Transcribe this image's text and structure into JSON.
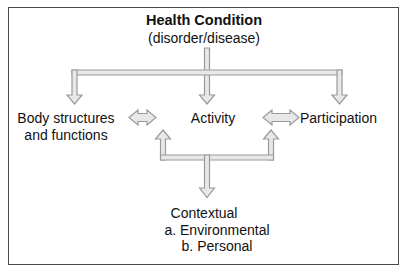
{
  "diagram": {
    "title": "Health Condition",
    "subtitle": "(disorder/disease)",
    "nodes": {
      "health_condition": {
        "label": "Health Condition",
        "sublabel": "(disorder/disease)"
      },
      "body_structures": {
        "line1": "Body structures",
        "line2": "and functions"
      },
      "activity": {
        "label": "Activity"
      },
      "participation": {
        "label": "Participation"
      },
      "contextual": {
        "heading": "Contextual",
        "item_a": "a. Environmental",
        "item_b": "b. Personal"
      }
    },
    "colors": {
      "border": "#4a4a4a",
      "arrow_stroke": "#9a9a9a",
      "arrow_fill": "#e8e8e8",
      "text": "#111111",
      "background": "#ffffff"
    },
    "connectors": [
      {
        "name": "health-to-branch",
        "type": "vertical-line",
        "from": "health_condition",
        "to": "branch-bar"
      },
      {
        "name": "branch-bar",
        "type": "horizontal-bar"
      },
      {
        "name": "branch-to-body-structures",
        "type": "arrow-down",
        "to": "body_structures"
      },
      {
        "name": "branch-to-activity",
        "type": "arrow-down",
        "to": "activity"
      },
      {
        "name": "branch-to-participation",
        "type": "arrow-down",
        "to": "participation"
      },
      {
        "name": "body-structures-activity",
        "type": "arrow-double-horizontal"
      },
      {
        "name": "activity-participation",
        "type": "arrow-double-horizontal"
      },
      {
        "name": "contextual-to-left",
        "type": "arrow-up"
      },
      {
        "name": "contextual-to-right",
        "type": "arrow-up"
      },
      {
        "name": "contextual-bar",
        "type": "horizontal-bar"
      },
      {
        "name": "contextual-down",
        "type": "arrow-down",
        "to": "contextual"
      }
    ]
  }
}
